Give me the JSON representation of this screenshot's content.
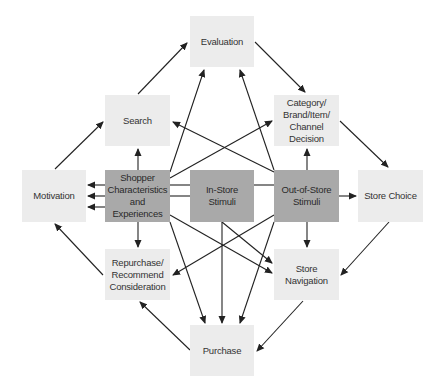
{
  "diagram": {
    "type": "flow",
    "colors": {
      "light_box": "#ececec",
      "dark_box": "#a9a9a9",
      "arrow": "#222222"
    },
    "nodes": {
      "evaluation": {
        "label": "Evaluation",
        "style": "light"
      },
      "search": {
        "label": "Search",
        "style": "light"
      },
      "category": {
        "label": "Category/ Brand/Item/ Channel Decision",
        "style": "light"
      },
      "motivation": {
        "label": "Motivation",
        "style": "light"
      },
      "shopper": {
        "label": "Shopper Characteristics and Experiences",
        "style": "dark"
      },
      "in_store": {
        "label": "In-Store Stimuli",
        "style": "dark"
      },
      "out_of_store": {
        "label": "Out-of-Store Stimuli",
        "style": "dark"
      },
      "store_choice": {
        "label": "Store Choice",
        "style": "light"
      },
      "repurchase": {
        "label": "Repurchase/ Recommend Consideration",
        "style": "light"
      },
      "store_navigation": {
        "label": "Store Navigation",
        "style": "light"
      },
      "purchase": {
        "label": "Purchase",
        "style": "light"
      }
    },
    "edges": [
      {
        "from": "motivation",
        "to": "search"
      },
      {
        "from": "search",
        "to": "evaluation"
      },
      {
        "from": "evaluation",
        "to": "category"
      },
      {
        "from": "category",
        "to": "store_choice"
      },
      {
        "from": "store_choice",
        "to": "store_navigation"
      },
      {
        "from": "store_navigation",
        "to": "purchase"
      },
      {
        "from": "purchase",
        "to": "repurchase"
      },
      {
        "from": "repurchase",
        "to": "motivation"
      },
      {
        "from": "shopper",
        "to": "motivation"
      },
      {
        "from": "in_store",
        "to": "motivation"
      },
      {
        "from": "out_of_store",
        "to": "motivation"
      },
      {
        "from": "shopper",
        "to": "search"
      },
      {
        "from": "shopper",
        "to": "evaluation"
      },
      {
        "from": "shopper",
        "to": "category"
      },
      {
        "from": "shopper",
        "to": "repurchase"
      },
      {
        "from": "shopper",
        "to": "store_navigation"
      },
      {
        "from": "shopper",
        "to": "purchase"
      },
      {
        "from": "in_store",
        "to": "purchase"
      },
      {
        "from": "in_store",
        "to": "store_navigation"
      },
      {
        "from": "out_of_store",
        "to": "search"
      },
      {
        "from": "out_of_store",
        "to": "evaluation"
      },
      {
        "from": "out_of_store",
        "to": "category"
      },
      {
        "from": "out_of_store",
        "to": "store_choice"
      },
      {
        "from": "out_of_store",
        "to": "store_navigation"
      },
      {
        "from": "out_of_store",
        "to": "repurchase"
      },
      {
        "from": "out_of_store",
        "to": "purchase"
      }
    ]
  }
}
